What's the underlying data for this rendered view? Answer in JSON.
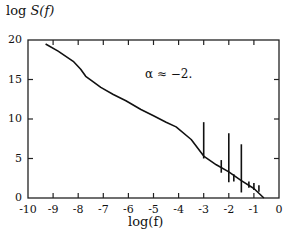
{
  "chart_data": {
    "type": "line",
    "title": "",
    "xlabel": "log(f)",
    "ylabel": "log S(f)",
    "xlim": [
      -10,
      0
    ],
    "ylim": [
      0,
      20
    ],
    "xticks": [
      "-10",
      "-9",
      "-8",
      "-7",
      "-6",
      "-5",
      "-4",
      "-3",
      "-2",
      "-1",
      "0"
    ],
    "yticks": [
      "0",
      "5",
      "10",
      "15",
      "20"
    ],
    "grid": false,
    "legend": null,
    "annotations": [
      {
        "text": "α ≈ −2.",
        "x": -4.7,
        "y": 15.6
      }
    ],
    "series": [
      {
        "name": "spectrum",
        "x": [
          -9.3,
          -8.8,
          -8.2,
          -7.9,
          -7.7,
          -7.4,
          -7.1,
          -6.6,
          -6.1,
          -5.5,
          -5.0,
          -4.5,
          -4.1,
          -3.5,
          -3.0,
          -2.5,
          -2.0,
          -1.5,
          -1.0,
          -0.6
        ],
        "y": [
          19.5,
          18.6,
          17.3,
          16.3,
          15.4,
          14.7,
          14.0,
          13.1,
          12.3,
          11.2,
          10.4,
          9.6,
          9.0,
          7.4,
          5.3,
          4.2,
          3.3,
          2.2,
          1.2,
          0.0
        ]
      }
    ],
    "spikes": [
      {
        "x": -3.0,
        "y_low": 5.0,
        "y_high": 9.6
      },
      {
        "x": -2.3,
        "y_low": 3.2,
        "y_high": 4.8
      },
      {
        "x": -2.0,
        "y_low": 2.0,
        "y_high": 8.2
      },
      {
        "x": -1.8,
        "y_low": 2.1,
        "y_high": 3.0
      },
      {
        "x": -1.5,
        "y_low": 0.7,
        "y_high": 6.8
      },
      {
        "x": -1.2,
        "y_low": 1.3,
        "y_high": 2.1
      },
      {
        "x": -1.0,
        "y_low": 1.0,
        "y_high": 1.9
      },
      {
        "x": -0.8,
        "y_low": 0.8,
        "y_high": 1.6
      }
    ]
  },
  "labels": {
    "ylabel_prefix": "log ",
    "ylabel_func": "S(f)",
    "xlabel": "log(f)",
    "annotation": "α ≈ −2."
  }
}
